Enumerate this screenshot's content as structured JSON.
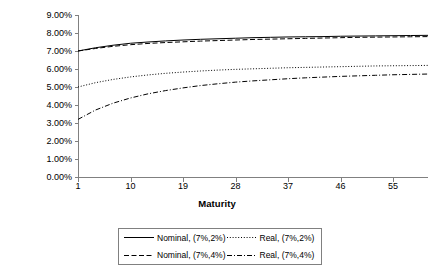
{
  "chart_data": {
    "type": "line",
    "title": "",
    "xlabel": "Maturity",
    "ylabel": "Interest rate (annualized)",
    "xlim": [
      1,
      61
    ],
    "ylim": [
      0,
      0.09
    ],
    "grid": false,
    "legend_position": "bottom",
    "x_tick_labels": [
      "1",
      "10",
      "19",
      "28",
      "37",
      "46",
      "55"
    ],
    "x_ticks": [
      1,
      10,
      19,
      28,
      37,
      46,
      55
    ],
    "y_tick_labels": [
      "0.00%",
      "1.00%",
      "2.00%",
      "3.00%",
      "4.00%",
      "5.00%",
      "6.00%",
      "7.00%",
      "8.00%",
      "9.00%"
    ],
    "y_ticks": [
      0,
      1,
      2,
      3,
      4,
      5,
      6,
      7,
      8,
      9
    ],
    "x": [
      1,
      4,
      7,
      10,
      13,
      16,
      19,
      22,
      25,
      28,
      31,
      34,
      37,
      40,
      43,
      46,
      49,
      52,
      55,
      58,
      61
    ],
    "series": [
      {
        "name": "Nominal, (7%,2%)",
        "line_style": "solid",
        "color": "#000000",
        "values": [
          7.0,
          7.18,
          7.32,
          7.43,
          7.5,
          7.56,
          7.61,
          7.65,
          7.68,
          7.71,
          7.74,
          7.76,
          7.78,
          7.79,
          7.8,
          7.82,
          7.83,
          7.84,
          7.85,
          7.86,
          7.87
        ]
      },
      {
        "name": "Nominal, (7%,4%)",
        "line_style": "dashed",
        "color": "#000000",
        "values": [
          7.0,
          7.14,
          7.26,
          7.35,
          7.42,
          7.47,
          7.51,
          7.55,
          7.58,
          7.61,
          7.64,
          7.66,
          7.68,
          7.7,
          7.72,
          7.74,
          7.76,
          7.77,
          7.78,
          7.79,
          7.8
        ]
      },
      {
        "name": "Real, (7%,2%)",
        "line_style": "dotted",
        "color": "#000000",
        "values": [
          5.0,
          5.24,
          5.42,
          5.56,
          5.67,
          5.76,
          5.83,
          5.89,
          5.94,
          5.98,
          6.01,
          6.04,
          6.07,
          6.09,
          6.11,
          6.13,
          6.15,
          6.17,
          6.18,
          6.19,
          6.2
        ]
      },
      {
        "name": "Real, (7%,4%)",
        "line_style": "dashdot",
        "color": "#000000",
        "values": [
          3.2,
          3.72,
          4.1,
          4.39,
          4.62,
          4.8,
          4.95,
          5.08,
          5.18,
          5.27,
          5.34,
          5.4,
          5.46,
          5.51,
          5.55,
          5.59,
          5.62,
          5.65,
          5.68,
          5.7,
          5.72
        ]
      }
    ]
  },
  "legend": {
    "items": [
      {
        "label": "Nominal, (7%,2%)",
        "style": "solid"
      },
      {
        "label": "Real, (7%,2%)",
        "style": "dotted"
      },
      {
        "label": "Nominal, (7%,4%)",
        "style": "dashed"
      },
      {
        "label": "Real, (7%,4%)",
        "style": "dashdot"
      }
    ]
  },
  "axes": {
    "axis_color": "#808080"
  }
}
